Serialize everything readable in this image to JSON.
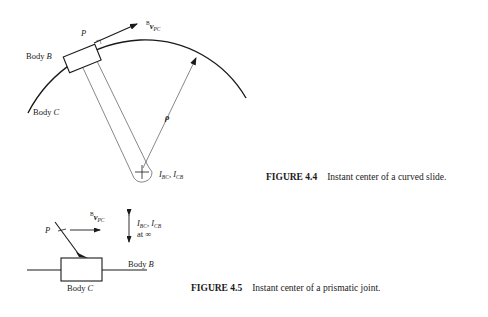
{
  "figures": [
    {
      "id": "fig-4-4",
      "caption": {
        "number": "FIGURE 4.4",
        "text": "Instant center of a curved slide."
      },
      "labels": {
        "point": "P",
        "velocity_super": "B",
        "velocity_vector": "v",
        "velocity_sub": "PC",
        "body_b_prefix": "Body ",
        "body_b_letter": "B",
        "body_c_prefix": "Body ",
        "body_c_letter": "C",
        "radius_vector": "ρ",
        "instant_center_1": "I",
        "instant_center_1_sub": "BC",
        "separator": ", ",
        "instant_center_2": "I",
        "instant_center_2_sub": "CB"
      }
    },
    {
      "id": "fig-4-5",
      "caption": {
        "number": "FIGURE 4.5",
        "text": "Instant center of a prismatic joint."
      },
      "labels": {
        "point": "P",
        "velocity_super": "B",
        "velocity_vector": "v",
        "velocity_sub": "PC",
        "instant_center_1": "I",
        "instant_center_1_sub": "BC",
        "separator": ", ",
        "instant_center_2": "I",
        "instant_center_2_sub": "CB",
        "at_infinity": "at ∞",
        "body_b_prefix": "Body ",
        "body_b_letter": "B",
        "body_c_prefix": "Body ",
        "body_c_letter": "C"
      }
    }
  ],
  "colors": {
    "ink": "#1a1a1a",
    "thin_line": "#555555",
    "background": "#ffffff"
  }
}
